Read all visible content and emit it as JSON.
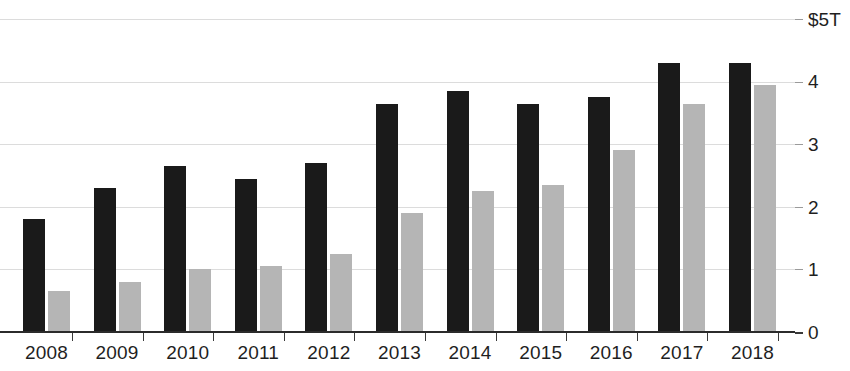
{
  "chart_data": {
    "type": "bar",
    "title": "",
    "subtitle": "",
    "xlabel": "",
    "ylabel": "",
    "categories": [
      "2008",
      "2009",
      "2010",
      "2011",
      "2012",
      "2013",
      "2014",
      "2015",
      "2016",
      "2017",
      "2018"
    ],
    "series": [
      {
        "name": "series-dark",
        "color": "#1a1a1a",
        "values": [
          1.8,
          2.3,
          2.65,
          2.45,
          2.7,
          3.65,
          3.85,
          3.65,
          3.75,
          4.3,
          4.3
        ]
      },
      {
        "name": "series-light",
        "color": "#b5b5b5",
        "values": [
          0.65,
          0.8,
          1.0,
          1.05,
          1.25,
          1.9,
          2.25,
          2.35,
          2.9,
          3.65,
          3.95
        ]
      }
    ],
    "ylim": [
      0,
      5
    ],
    "yticks": [
      0,
      1,
      2,
      3,
      4,
      5
    ],
    "ytick_labels": [
      "0",
      "1",
      "2",
      "3",
      "4",
      "$5T"
    ],
    "grid": true,
    "grid_axis": "y",
    "legend": "none",
    "units": "trillions of US dollars",
    "axis_colors": {
      "baseline": "#2b2b2b",
      "gridline": "#dcdcdc",
      "text": "#1f1f1f"
    }
  },
  "axis": {
    "y": {
      "t5": "$5T",
      "t4": "4",
      "t3": "3",
      "t2": "2",
      "t1": "1",
      "t0": "0"
    },
    "x": {
      "y2008": "2008",
      "y2009": "2009",
      "y2010": "2010",
      "y2011": "2011",
      "y2012": "2012",
      "y2013": "2013",
      "y2014": "2014",
      "y2015": "2015",
      "y2016": "2016",
      "y2017": "2017",
      "y2018": "2018"
    }
  }
}
